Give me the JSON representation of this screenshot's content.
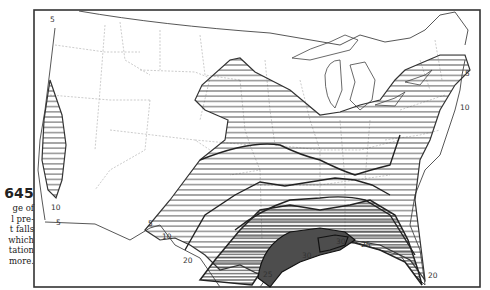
{
  "figure": {
    "map_number": "645",
    "caption_lines": [
      "ge of",
      "l pre-",
      "t falls",
      "which",
      "tation",
      "more."
    ]
  },
  "map": {
    "subject": "Percentage of annual precipitation falling in heavy rains (United States)",
    "frame_color": "#333333",
    "hatch_color": "#444444",
    "isoline_labels": [
      {
        "id": "pacific-nw-5",
        "text": "5",
        "x": 50,
        "y": 22
      },
      {
        "id": "california-10",
        "text": "10",
        "x": 53,
        "y": 212
      },
      {
        "id": "california-5",
        "text": "5",
        "x": 57,
        "y": 227
      },
      {
        "id": "texas-border-5",
        "text": "5",
        "x": 149,
        "y": 225
      },
      {
        "id": "texas-10",
        "text": "10",
        "x": 163,
        "y": 238
      },
      {
        "id": "mexico-20",
        "text": "20",
        "x": 184,
        "y": 262
      },
      {
        "id": "gulf-25-west",
        "text": "25",
        "x": 265,
        "y": 277
      },
      {
        "id": "gulf-30-west",
        "text": "30",
        "x": 303,
        "y": 258
      },
      {
        "id": "gulf-30-east",
        "text": "30",
        "x": 337,
        "y": 245
      },
      {
        "id": "gulf-25-east",
        "text": "25",
        "x": 362,
        "y": 248
      },
      {
        "id": "atlantic-20",
        "text": "20",
        "x": 428,
        "y": 278
      },
      {
        "id": "new-england-5",
        "text": "5",
        "x": 465,
        "y": 75
      },
      {
        "id": "new-england-10",
        "text": "10",
        "x": 462,
        "y": 111
      }
    ]
  }
}
